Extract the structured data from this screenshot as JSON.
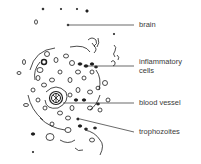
{
  "diagram": {
    "type": "histology-illustration",
    "labels": [
      {
        "id": "brain",
        "text": "brain",
        "x": 139,
        "y": 21
      },
      {
        "id": "inflammatory-cells",
        "text": "inflammatory",
        "text2": "cells",
        "x": 139,
        "y": 58
      },
      {
        "id": "blood-vessel",
        "text": "blood vessel",
        "x": 139,
        "y": 99
      },
      {
        "id": "trophozoites",
        "text": "trophozoites",
        "x": 139,
        "y": 128
      }
    ],
    "leader_lines": [
      {
        "for": "brain",
        "x1": 68,
        "y1": 25,
        "x2": 134,
        "y2": 25
      },
      {
        "for": "inflammatory-cells",
        "x1": 85,
        "y1": 66,
        "x2": 134,
        "y2": 66
      },
      {
        "for": "blood-vessel",
        "x1": 63,
        "y1": 103,
        "x2": 134,
        "y2": 103
      },
      {
        "for": "trophozoites",
        "x1": 80,
        "y1": 119,
        "x2": 134,
        "y2": 132
      }
    ],
    "colors": {
      "ink": "#1e1e1e",
      "label": "#3a3a3a",
      "background": "#ffffff"
    }
  }
}
